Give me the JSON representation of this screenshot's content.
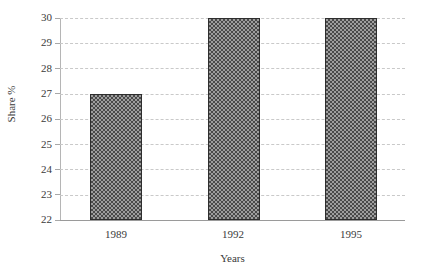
{
  "chart_data": {
    "type": "bar",
    "title": "",
    "subtitle": "",
    "xlabel": "Years",
    "ylabel": "Share %",
    "categories": [
      "1989",
      "1992",
      "1995"
    ],
    "values": [
      25,
      27,
      30
    ],
    "series": [
      {
        "name": "Share %",
        "values": [
          25,
          27,
          30
        ]
      }
    ],
    "ylim": [
      22,
      30
    ],
    "yticks": [
      22,
      23,
      24,
      25,
      26,
      27,
      28,
      29,
      30
    ],
    "ytick_labels": [
      "22",
      "23",
      "24",
      "25",
      "26",
      "27",
      "28",
      "29",
      "30"
    ],
    "grid": true,
    "grid_axis": "y",
    "grid_style": "dashed",
    "legend": false,
    "legend_position": "none",
    "annotations": [],
    "colors": {
      "background": "#ffffff",
      "bar_fill": "#9e9e9e",
      "bar_pattern": "#4a4a4a",
      "bar_border": "#2e2e2e",
      "gridline": "#c9c9c9",
      "axis": "#9a9a9a",
      "text": "#3a3a3a"
    },
    "bar_fill_style": "checkerboard-dither"
  }
}
